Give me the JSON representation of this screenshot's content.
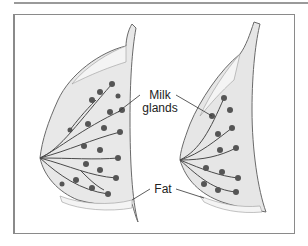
{
  "figure": {
    "labels": {
      "milk_line1": "Milk",
      "milk_line2": "glands",
      "fat": "Fat"
    },
    "panels": [
      {
        "name": "dense-breast",
        "description": "Breast cross-section with many milk glands"
      },
      {
        "name": "fatty-breast",
        "description": "Breast cross-section with fewer milk glands"
      }
    ],
    "colors": {
      "outline": "#6a6a6a",
      "tissue_fill": "#e6e6e6",
      "fat_fill": "#f4f4f4",
      "gland": "#4a4a4a",
      "frame": "#8a8a8a"
    }
  }
}
